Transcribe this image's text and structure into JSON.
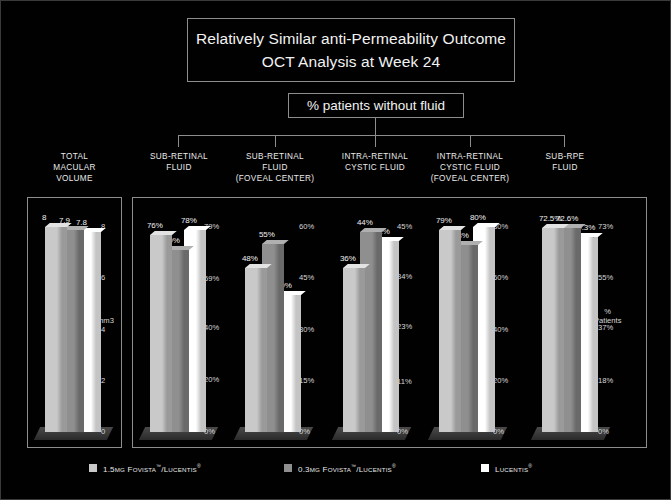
{
  "slide": {
    "title_line1": "Relatively Similar anti-Permeability Outcome",
    "title_line2": "OCT Analysis at Week 24",
    "subtitle": "% patients without fluid"
  },
  "colors": {
    "background": "#010101",
    "border": "#8d8d8d",
    "text": "#f2f2f2",
    "series1": "#c9c9c9",
    "series2": "#8f8f8f",
    "series3": "#ffffff"
  },
  "legend": {
    "items": [
      {
        "name": "1.5MG FOVISTA(TM)/LUCENTIS(R)",
        "dose": "1.5",
        "unit": "MG",
        "brand": "F",
        "brand_rest": "OVISTA",
        "tm": "™",
        "slash": "/L",
        "brand2_rest": "UCENTIS",
        "reg": "®",
        "color": "#c9c9c9"
      },
      {
        "name": "0.3MG FOVISTA(TM)/LUCENTIS(R)",
        "dose": "0.3",
        "unit": "MG",
        "brand": "F",
        "brand_rest": "OVISTA",
        "tm": "™",
        "slash": "/L",
        "brand2_rest": "UCENTIS",
        "reg": "®",
        "color": "#8f8f8f"
      },
      {
        "name": "LUCENTIS(R)",
        "dose": "",
        "unit": "",
        "brand": "L",
        "brand_rest": "UCENTIS",
        "tm": "",
        "slash": "",
        "brand2_rest": "",
        "reg": "®",
        "color": "#ffffff"
      }
    ]
  },
  "chart_data": [
    {
      "type": "bar",
      "id": "total-macular-volume",
      "title": "TOTAL MACULAR VOLUME",
      "title_lines": [
        "TOTAL",
        "MACULAR",
        "VOLUME"
      ],
      "categories": [
        "1.5MG Fovista/Lucentis",
        "0.3MG Fovista/Lucentis",
        "Lucentis"
      ],
      "values": [
        8,
        7.9,
        7.8
      ],
      "value_labels": [
        "8",
        "7.9",
        "7.8"
      ],
      "ylabel": "mm3",
      "ylim": [
        0,
        8
      ],
      "ticks": [
        8,
        6,
        4,
        2,
        0
      ],
      "tick_labels": [
        "8",
        "6",
        "4",
        "2",
        "0"
      ],
      "unit_label": "mm3",
      "grid": false
    },
    {
      "type": "bar",
      "id": "sub-retinal-fluid",
      "title": "SUB-RETINAL FLUID",
      "title_lines": [
        "SUB-RETINAL",
        "FLUID"
      ],
      "categories": [
        "1.5MG Fovista/Lucentis",
        "0.3MG Fovista/Lucentis",
        "Lucentis"
      ],
      "values": [
        76,
        70,
        78
      ],
      "value_labels": [
        "76%",
        "70%",
        "78%"
      ],
      "ylabel": "",
      "ylim": [
        0,
        79
      ],
      "ticks": [
        79,
        59,
        40,
        20,
        0
      ],
      "tick_labels": [
        "79%",
        "59%",
        "40%",
        "20%",
        "0%"
      ],
      "unit_label": "",
      "grid": false
    },
    {
      "type": "bar",
      "id": "sub-retinal-fluid-foveal-center",
      "title": "SUB-RETINAL FLUID (FOVEAL CENTER)",
      "title_lines": [
        "SUB-RETINAL",
        "FLUID",
        "(FOVEAL CENTER)"
      ],
      "categories": [
        "1.5MG Fovista/Lucentis",
        "0.3MG Fovista/Lucentis",
        "Lucentis"
      ],
      "values": [
        48,
        55,
        40
      ],
      "value_labels": [
        "48%",
        "55%",
        "40%"
      ],
      "ylabel": "",
      "ylim": [
        0,
        60
      ],
      "ticks": [
        60,
        45,
        30,
        15,
        0
      ],
      "tick_labels": [
        "60%",
        "45%",
        "30%",
        "15%",
        "0%"
      ],
      "unit_label": "",
      "grid": false
    },
    {
      "type": "bar",
      "id": "intra-retinal-cystic-fluid",
      "title": "INTRA-RETINAL CYSTIC FLUID",
      "title_lines": [
        "INTRA-RETINAL",
        "CYSTIC FLUID"
      ],
      "categories": [
        "1.5MG Fovista/Lucentis",
        "0.3MG Fovista/Lucentis",
        "Lucentis"
      ],
      "values": [
        36,
        44,
        42
      ],
      "value_labels": [
        "36%",
        "44%",
        "42%"
      ],
      "ylabel": "",
      "ylim": [
        0,
        45
      ],
      "ticks": [
        45,
        34,
        23,
        11,
        0
      ],
      "tick_labels": [
        "45%",
        "34%",
        "23%",
        "11%",
        "0%"
      ],
      "unit_label": "",
      "grid": false
    },
    {
      "type": "bar",
      "id": "intra-retinal-cystic-fluid-foveal-center",
      "title": "INTRA-RETINAL CYSTIC FLUID (FOVEAL CENTER)",
      "title_lines": [
        "INTRA-RETINAL",
        "CYSTIC FLUID",
        "(FOVEAL CENTER)"
      ],
      "categories": [
        "1.5MG Fovista/Lucentis",
        "0.3MG Fovista/Lucentis",
        "Lucentis"
      ],
      "values": [
        79,
        73,
        80
      ],
      "value_labels": [
        "79%",
        "73%",
        "80%"
      ],
      "ylabel": "",
      "ylim": [
        0,
        80
      ],
      "ticks": [
        80,
        60,
        40,
        20,
        0
      ],
      "tick_labels": [
        "80%",
        "60%",
        "40%",
        "20%",
        "0%"
      ],
      "unit_label": "",
      "grid": false
    },
    {
      "type": "bar",
      "id": "sub-rpe-fluid",
      "title": "SUB-RPE FLUID",
      "title_lines": [
        "SUB-RPE",
        "FLUID"
      ],
      "categories": [
        "1.5MG Fovista/Lucentis",
        "0.3MG Fovista/Lucentis",
        "Lucentis"
      ],
      "values": [
        72.5,
        72.6,
        69.3
      ],
      "value_labels": [
        "72.5%",
        "72.6%",
        "69.3%"
      ],
      "ylabel": "% Patients",
      "ylim": [
        0,
        73
      ],
      "ticks": [
        73,
        55,
        37,
        18,
        0
      ],
      "tick_labels": [
        "73%",
        "55%",
        "37%",
        "18%",
        "0%"
      ],
      "unit_label": "% Patients",
      "unit_label_lines": [
        "%",
        "Patients"
      ],
      "grid": false
    }
  ]
}
